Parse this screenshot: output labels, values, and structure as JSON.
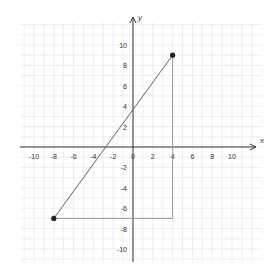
{
  "chart_data": {
    "type": "line",
    "title": "",
    "xlabel": "x",
    "ylabel": "y",
    "xlim": [
      -11,
      11
    ],
    "ylim": [
      -12,
      12
    ],
    "grid": true,
    "x_ticks": [
      -10,
      -8,
      -6,
      -4,
      -2,
      0,
      2,
      4,
      6,
      8,
      10
    ],
    "y_ticks": [
      10,
      8,
      6,
      4,
      2,
      -2,
      -4,
      -6,
      -8,
      -10
    ],
    "x_tick_labels": [
      "-10",
      "-8",
      "-6",
      "-4",
      "-2",
      "0",
      "2",
      "4",
      "6",
      "8",
      "10"
    ],
    "y_tick_labels": [
      "10",
      "8",
      "6",
      "4",
      "2",
      "-2",
      "-4",
      "-6",
      "-8",
      "-10"
    ],
    "points": [
      {
        "x": -8,
        "y": -7
      },
      {
        "x": 4,
        "y": 9
      }
    ],
    "segments": [
      {
        "name": "hypotenuse",
        "from": [
          -8,
          -7
        ],
        "to": [
          4,
          9
        ]
      },
      {
        "name": "horizontal-leg",
        "from": [
          -8,
          -7
        ],
        "to": [
          4,
          -7
        ]
      },
      {
        "name": "vertical-leg",
        "from": [
          4,
          -7
        ],
        "to": [
          4,
          9
        ]
      }
    ],
    "colors": {
      "grid": "#e6e6e6",
      "axis": "#333333",
      "line": "#666666",
      "leg": "#999999",
      "point": "#222222"
    }
  }
}
